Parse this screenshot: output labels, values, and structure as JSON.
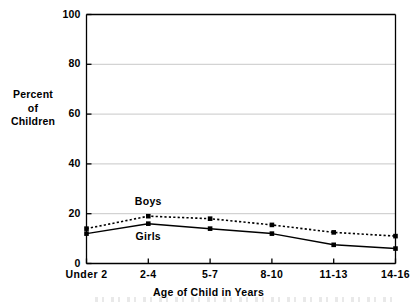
{
  "chart_data": {
    "type": "line",
    "title": "",
    "xlabel": "Age of Child in Years",
    "ylabel": "Percent of Children",
    "ylabel_lines": [
      "Percent",
      "of",
      "Children"
    ],
    "categories": [
      "Under 2",
      "2-4",
      "5-7",
      "8-10",
      "11-13",
      "14-16"
    ],
    "series": [
      {
        "name": "Boys",
        "values": [
          14,
          19,
          18,
          15.5,
          12.5,
          11
        ],
        "line_style": "dotted",
        "marker": "square",
        "color": "#000000"
      },
      {
        "name": "Girls",
        "values": [
          12,
          16,
          14,
          12,
          7.5,
          6
        ],
        "line_style": "solid",
        "marker": "square",
        "color": "#000000"
      }
    ],
    "ylim": [
      0,
      100
    ],
    "yticks": [
      0,
      20,
      40,
      60,
      80,
      100
    ],
    "ytick_labels": [
      "0",
      "20",
      "40",
      "60",
      "80",
      "100"
    ],
    "grid": "horizontal",
    "grid_color": "#c8c8c8",
    "legend": "inline-annotations",
    "annotations": [
      {
        "text": "Boys",
        "category": "2-4",
        "value": 24.5
      },
      {
        "text": "Girls",
        "category": "2-4",
        "value": 10.5
      }
    ],
    "axis_color": "#000000",
    "background": "#ffffff"
  }
}
